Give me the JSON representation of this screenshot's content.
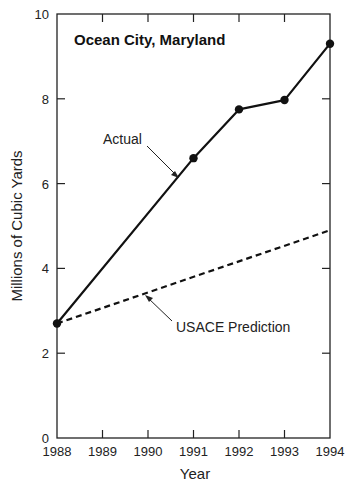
{
  "chart_data": {
    "type": "line",
    "title": "Ocean City, Maryland",
    "xlabel": "Year",
    "ylabel": "Millions of Cubic Yards",
    "x": [
      1988,
      1989,
      1990,
      1991,
      1992,
      1993,
      1994
    ],
    "xticks": [
      "1988",
      "1989",
      "1990",
      "1991",
      "1992",
      "1993",
      "1994"
    ],
    "yticks": [
      "0",
      "2",
      "4",
      "6",
      "8",
      "10"
    ],
    "ylim": [
      0,
      10
    ],
    "xlim": [
      1988,
      1994
    ],
    "grid": false,
    "series": [
      {
        "name": "Actual",
        "style": "solid",
        "markers": true,
        "points": [
          {
            "x": 1988,
            "y": 2.7
          },
          {
            "x": 1991,
            "y": 6.6
          },
          {
            "x": 1992,
            "y": 7.75
          },
          {
            "x": 1993,
            "y": 7.97
          },
          {
            "x": 1994,
            "y": 9.3
          }
        ]
      },
      {
        "name": "USACE Prediction",
        "style": "dashed",
        "markers": false,
        "points": [
          {
            "x": 1988,
            "y": 2.7
          },
          {
            "x": 1994,
            "y": 4.9
          }
        ]
      }
    ],
    "annotations": [
      {
        "text": "Actual",
        "points_to": "Actual series near 1990.8"
      },
      {
        "text": "USACE Prediction",
        "points_to": "USACE Prediction near 1989.8"
      }
    ]
  }
}
